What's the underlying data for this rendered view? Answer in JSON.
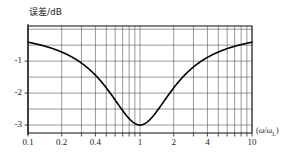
{
  "chart_data": {
    "type": "line",
    "title": "",
    "subtitle": "",
    "ylabel": "误差/dB",
    "xlabel": "(ω/ωL)",
    "xlabel_parts": {
      "open": "(",
      "omega1": "ω",
      "slash": "/",
      "omega2": "ω",
      "subscript": "L",
      "close": ")"
    },
    "xscale": "log",
    "xlim": [
      0.1,
      10
    ],
    "ylim": [
      -3.25,
      0.1
    ],
    "grid": true,
    "grid_minor": true,
    "legend": null,
    "xticks": [
      {
        "value": 0.1,
        "label": "0.1"
      },
      {
        "value": 0.2,
        "label": "0.2"
      },
      {
        "value": 0.4,
        "label": "0.4"
      },
      {
        "value": 1,
        "label": "1"
      },
      {
        "value": 2,
        "label": "2"
      },
      {
        "value": 4,
        "label": "4"
      },
      {
        "value": 10,
        "label": "10"
      }
    ],
    "xminor_ticks": [
      0.1,
      0.2,
      0.3,
      0.4,
      0.5,
      0.6,
      0.7,
      0.8,
      0.9,
      1,
      2,
      3,
      4,
      5,
      6,
      7,
      8,
      9,
      10
    ],
    "yticks": [
      {
        "value": -1,
        "label": "-1"
      },
      {
        "value": -2,
        "label": "-2"
      },
      {
        "value": -3,
        "label": "-3"
      }
    ],
    "ygrid_values": [
      0,
      -0.5,
      -1,
      -1.5,
      -2,
      -2.5,
      -3
    ],
    "series": [
      {
        "name": "magnitude error",
        "color": "#000000",
        "x": [
          0.1,
          0.12,
          0.15,
          0.18,
          0.2,
          0.25,
          0.3,
          0.35,
          0.4,
          0.45,
          0.5,
          0.55,
          0.6,
          0.65,
          0.7,
          0.75,
          0.8,
          0.85,
          0.9,
          0.94,
          0.97,
          0.99,
          1.0,
          1.01,
          1.03,
          1.06,
          1.1,
          1.18,
          1.25,
          1.35,
          1.45,
          1.6,
          1.8,
          2.0,
          2.3,
          2.6,
          3.0,
          3.5,
          4.0,
          5.0,
          6.0,
          7.0,
          8.0,
          9.0,
          10.0
        ],
        "y": [
          -0.043,
          -0.062,
          -0.097,
          -0.138,
          -0.17,
          -0.26,
          -0.37,
          -0.49,
          -0.64,
          -0.79,
          -0.97,
          -1.16,
          -1.36,
          -1.58,
          -1.82,
          -2.08,
          -2.36,
          -2.67,
          -3.0,
          -2.9,
          -2.6,
          -2.3,
          -3.0,
          -2.3,
          -2.6,
          -2.8,
          -2.75,
          -2.45,
          -2.2,
          -1.95,
          -1.75,
          -1.5,
          -1.25,
          -1.06,
          -0.85,
          -0.7,
          -0.55,
          -0.42,
          -0.33,
          -0.22,
          -0.15,
          -0.11,
          -0.09,
          -0.07,
          -0.05
        ]
      }
    ],
    "min_point": {
      "x": 1,
      "y": -3
    }
  }
}
